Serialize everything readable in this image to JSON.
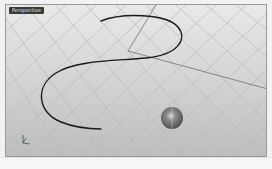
{
  "viewport": {
    "label": "Perspective",
    "type": "perspective-3d-viewport",
    "background_top": "#e9e9e9",
    "background_bottom": "#bdbdbd",
    "grid_color": "#b4b4b4",
    "axis_line_color": "#707070"
  },
  "scene": {
    "curve": {
      "name": "s-curve",
      "color": "#1a1a1a"
    },
    "sphere": {
      "name": "sphere",
      "center_x": 166,
      "center_y": 113,
      "radius": 11,
      "color": "#6e6e6e"
    }
  },
  "axis_icon": {
    "labels": [
      "x",
      "y",
      "z"
    ]
  },
  "statusbar": {
    "text": ""
  }
}
